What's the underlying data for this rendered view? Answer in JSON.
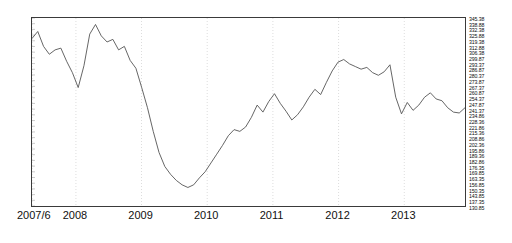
{
  "chart_data": {
    "type": "line",
    "title": "",
    "subtitle": "",
    "xlabel": "",
    "ylabel": "",
    "grid": true,
    "grid_axis": "x",
    "legend": false,
    "legend_position": "none",
    "line_color": "#555555",
    "frame_color": "#3a3a3a",
    "gridline_color": "#cfcfcf",
    "background": "#ffffff",
    "x_tick_labels": [
      "2007/6",
      "2008",
      "2009",
      "2010",
      "2011",
      "2012",
      "2013"
    ],
    "x_tick_positions": [
      0.0,
      0.1014,
      0.2529,
      0.4046,
      0.5563,
      0.708,
      0.8598
    ],
    "y_axis_side": "right",
    "ylim": [
      130.85,
      345.38
    ],
    "y_tick_step": 6.5,
    "y_tick_labels": [
      "345.38",
      "338.88",
      "332.38",
      "325.88",
      "319.38",
      "312.88",
      "306.38",
      "299.87",
      "293.37",
      "286.87",
      "280.37",
      "273.87",
      "267.37",
      "260.87",
      "254.37",
      "247.87",
      "241.37",
      "234.86",
      "228.36",
      "221.86",
      "215.36",
      "208.86",
      "202.36",
      "195.86",
      "189.36",
      "182.86",
      "176.35",
      "169.85",
      "163.35",
      "156.85",
      "150.35",
      "143.85",
      "137.35",
      "130.85"
    ],
    "x": [
      "2007/6",
      "2007/7",
      "2007/8",
      "2007/9",
      "2007/10",
      "2007/11",
      "2007/12",
      "2008/1",
      "2008/2",
      "2008/3",
      "2008/4",
      "2008/5",
      "2008/6",
      "2008/7",
      "2008/8",
      "2008/9",
      "2008/10",
      "2008/11",
      "2008/12",
      "2009/1",
      "2009/2",
      "2009/3",
      "2009/4",
      "2009/5",
      "2009/6",
      "2009/7",
      "2009/8",
      "2009/9",
      "2009/10",
      "2009/11",
      "2009/12",
      "2010/1",
      "2010/2",
      "2010/3",
      "2010/4",
      "2010/5",
      "2010/6",
      "2010/7",
      "2010/8",
      "2010/9",
      "2010/10",
      "2010/11",
      "2010/12",
      "2011/1",
      "2011/2",
      "2011/3",
      "2011/4",
      "2011/5",
      "2011/6",
      "2011/7",
      "2011/8",
      "2011/9",
      "2011/10",
      "2011/11",
      "2011/12",
      "2012/1",
      "2012/2",
      "2012/3",
      "2012/4",
      "2012/5",
      "2012/6",
      "2012/7",
      "2012/8",
      "2012/9",
      "2012/10",
      "2012/11",
      "2012/12",
      "2013/1",
      "2013/2",
      "2013/3",
      "2013/4",
      "2013/5",
      "2013/6",
      "2013/7",
      "2013/8",
      "2013/9"
    ],
    "values": [
      322.0,
      330.0,
      313.0,
      304.0,
      309.0,
      311.0,
      296.0,
      283.0,
      266.0,
      291.0,
      327.0,
      338.0,
      325.0,
      318.0,
      321.0,
      309.0,
      313.0,
      297.0,
      288.0,
      266.0,
      243.0,
      216.0,
      192.0,
      176.0,
      167.0,
      160.0,
      155.0,
      152.0,
      155.0,
      163.0,
      170.0,
      180.0,
      190.0,
      200.0,
      211.0,
      218.0,
      216.0,
      221.0,
      232.0,
      246.0,
      238.0,
      250.0,
      259.0,
      248.0,
      239.0,
      229.0,
      235.0,
      244.0,
      255.0,
      264.0,
      258.0,
      272.0,
      285.0,
      295.0,
      298.0,
      293.0,
      290.0,
      287.0,
      289.0,
      283.0,
      280.0,
      284.0,
      292.0,
      255.0,
      236.0,
      249.0,
      240.0,
      246.0,
      255.0,
      260.0,
      253.0,
      251.0,
      243.0,
      238.0,
      237.0,
      243.0
    ]
  }
}
